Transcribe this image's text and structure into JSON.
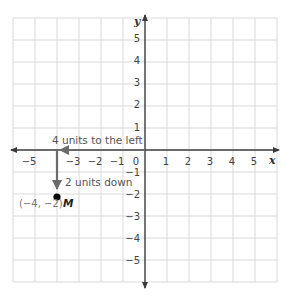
{
  "diagram": {
    "title": "",
    "type": "coordinate-plane",
    "x_axis": {
      "label": "x",
      "range": [
        -6,
        6
      ],
      "tick_labels": [
        "−5",
        "−3",
        "−2",
        "−1",
        "0",
        "1",
        "2",
        "3",
        "4",
        "5"
      ]
    },
    "y_axis": {
      "label": "y",
      "range": [
        -6,
        6
      ],
      "tick_labels_positive": [
        "5",
        "4",
        "3",
        "2",
        "1"
      ],
      "tick_labels_negative": [
        "−1",
        "−2",
        "−3",
        "−4",
        "−5"
      ]
    },
    "grid": true,
    "translations": [
      {
        "label": "4 units to the left",
        "from": [
          0,
          0
        ],
        "to": [
          -4,
          0
        ]
      },
      {
        "label": "2 units down",
        "from": [
          -4,
          0
        ],
        "to": [
          -4,
          -2
        ]
      }
    ],
    "point": {
      "name": "M",
      "coords": [
        -4,
        -2
      ],
      "coord_label": "(−4, −2)"
    },
    "colors": {
      "grid": "#d9d9d9",
      "axis": "#3a3a3a",
      "arrow": "#6b6b6b",
      "point": "#000000"
    }
  }
}
